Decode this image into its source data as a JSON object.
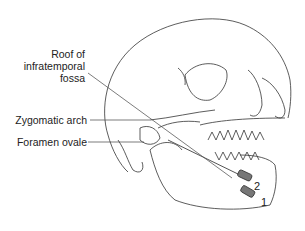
{
  "figure": {
    "labels": [
      {
        "id": "roof",
        "lines": [
          "Roof of",
          "infratemporal",
          "fossa"
        ]
      },
      {
        "id": "zygomatic",
        "text": "Zygomatic arch"
      },
      {
        "id": "foramen",
        "text": "Foramen ovale"
      }
    ],
    "needle_numbers": [
      "2",
      "1"
    ]
  }
}
